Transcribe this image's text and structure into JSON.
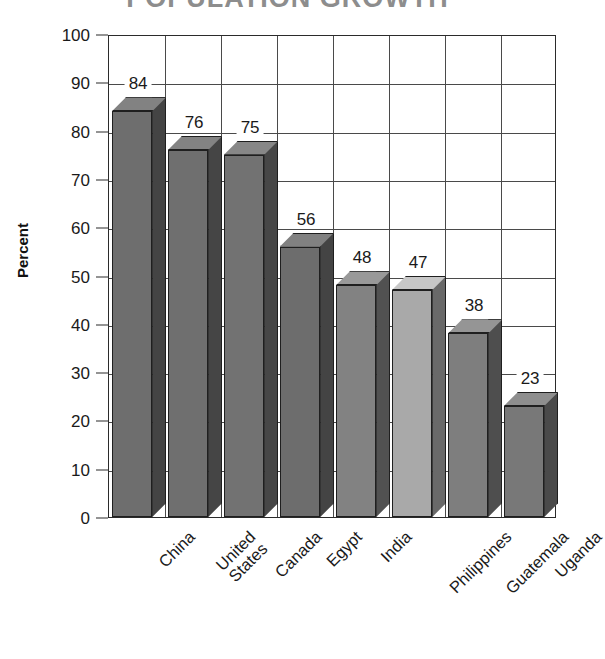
{
  "chart_data": {
    "type": "bar",
    "title": "",
    "xlabel": "",
    "ylabel": "Percent",
    "ylim": [
      0,
      100
    ],
    "ytick_step": 10,
    "ytick_labels": [
      "0",
      "10",
      "20",
      "30",
      "40",
      "50",
      "60",
      "70",
      "80",
      "90",
      "100"
    ],
    "grid": true,
    "legend": "none",
    "style_3d": true,
    "categories": [
      "China",
      "United States",
      "Canada",
      "Egypt",
      "India",
      "Philippines",
      "Guatemala",
      "Uganda"
    ],
    "category_lines": [
      [
        "China"
      ],
      [
        "United",
        "States"
      ],
      [
        "Canada"
      ],
      [
        "Egypt"
      ],
      [
        "India"
      ],
      [
        "Philippines"
      ],
      [
        "Guatemala"
      ],
      [
        "Uganda"
      ]
    ],
    "values": [
      84,
      76,
      75,
      56,
      48,
      47,
      38,
      23
    ],
    "value_labels": [
      "84",
      "76",
      "75",
      "56",
      "48",
      "47",
      "38",
      "23"
    ],
    "bar_colors": [
      "#6e6e6e",
      "#6f6f6f",
      "#727272",
      "#6d6d6d",
      "#828282",
      "#a9a9a9",
      "#7e7e7e",
      "#787878"
    ]
  },
  "axis": {
    "y_title": "Percent"
  },
  "header": {
    "clipped_title": "POPULATION GROWTH"
  }
}
